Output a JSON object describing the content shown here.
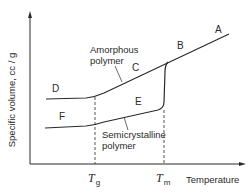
{
  "diagram": {
    "type": "specific-volume-vs-temperature",
    "axes": {
      "x_label": "Temperature",
      "y_label": "Specific volume, cc / g"
    },
    "markers": [
      {
        "symbol": "T",
        "sub": "g",
        "meaning": "glass transition temperature"
      },
      {
        "symbol": "T",
        "sub": "m",
        "meaning": "melting temperature"
      }
    ],
    "curves": [
      {
        "name": "Amorphous polymer",
        "label_line1": "Amorphous",
        "label_line2": "polymer",
        "points": [
          "D",
          "C",
          "B",
          "A"
        ]
      },
      {
        "name": "Semicrystalline polymer",
        "label_line1": "Semicrystalline",
        "label_line2": "polymer",
        "points": [
          "F",
          "E",
          "B",
          "A"
        ]
      }
    ],
    "point_labels": {
      "A": "A",
      "B": "B",
      "C": "C",
      "D": "D",
      "E": "E",
      "F": "F"
    },
    "colors": {
      "line": "#2a2a2a",
      "background": "#ffffff"
    }
  }
}
